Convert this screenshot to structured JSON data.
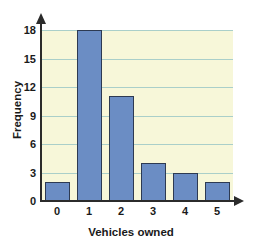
{
  "chart_data": {
    "type": "bar",
    "title": "",
    "xlabel": "Vehicles owned",
    "ylabel": "Frequency",
    "categories": [
      "0",
      "1",
      "2",
      "3",
      "4",
      "5"
    ],
    "values": [
      2,
      18,
      11,
      4,
      3,
      2
    ],
    "ylim": [
      0,
      18
    ],
    "yticks": [
      0,
      3,
      6,
      9,
      12,
      15,
      18
    ],
    "ytick_labels": [
      "0",
      "3",
      "6",
      "9",
      "12",
      "15",
      "18"
    ],
    "grid": true,
    "grid_axis": "y",
    "legend": false,
    "legend_position": "none",
    "colors": {
      "bar_fill": "#6b8dc4",
      "bar_border": "#2d3a52",
      "plot_background": "#f7f7d9",
      "gridline": "#aacfc9",
      "axis": "#2b2b2b",
      "text": "#1a1a1a",
      "page_background": "#ffffff"
    },
    "axis_arrows": {
      "y_axis": "up-arrow",
      "x_axis": "right-arrow"
    }
  }
}
